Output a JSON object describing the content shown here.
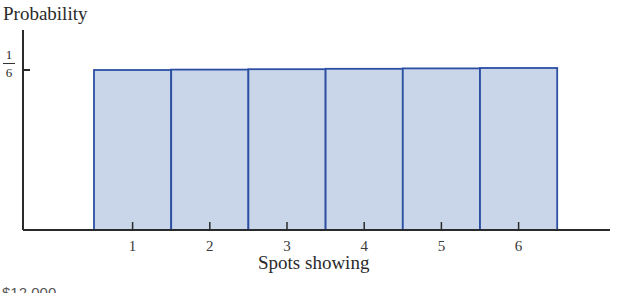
{
  "chart_data": {
    "type": "bar",
    "title": "",
    "xlabel": "Spots showing",
    "ylabel": "Probability",
    "categories": [
      "1",
      "2",
      "3",
      "4",
      "5",
      "6"
    ],
    "values": [
      0.1667,
      0.1667,
      0.1667,
      0.1667,
      0.1667,
      0.1667
    ],
    "y_ticks": [
      {
        "value": 0.1667,
        "label": "1/6"
      }
    ],
    "ylim": [
      0,
      0.2
    ],
    "grid": false,
    "legend": null,
    "bar_fill": "#c9d6ea",
    "bar_edge": "#2c4fa3"
  },
  "labels": {
    "ylabel": "Probability",
    "xlabel": "Spots showing",
    "ytick_num": "1",
    "ytick_den": "6",
    "xticks": [
      "1",
      "2",
      "3",
      "4",
      "5",
      "6"
    ],
    "cut_text": "$12,000"
  }
}
